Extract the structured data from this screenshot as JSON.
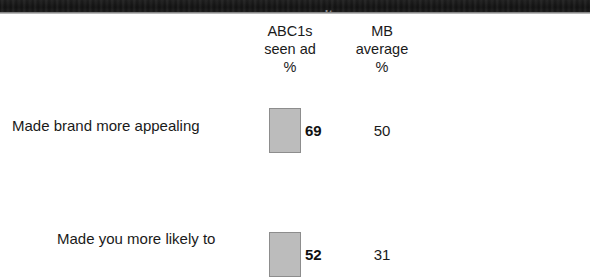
{
  "title_band": {
    "text": "survey results"
  },
  "table": {
    "columns": [
      {
        "id": "statement",
        "lines": []
      },
      {
        "id": "abc1s_seen_ad",
        "line1": "ABC1s",
        "line2": "seen ad",
        "line3": "%"
      },
      {
        "id": "mb_average",
        "line1": "MB",
        "line2": "average",
        "line3": "%"
      }
    ],
    "rows": [
      {
        "label": "Made brand more appealing",
        "label_line2": "",
        "abc1s_seen_ad": "69",
        "mb_average": "50"
      },
      {
        "label": "Made you more likely to",
        "label_line2": "",
        "abc1s_seen_ad": "52",
        "mb_average": "31"
      }
    ]
  },
  "chart_data": {
    "type": "bar",
    "title": "",
    "subtitle": "",
    "xlabel": "",
    "ylabel": "",
    "categories": [
      "Made brand more appealing",
      "Made you more likely to"
    ],
    "series": [
      {
        "name": "ABC1s seen ad %",
        "values": [
          69,
          50
        ]
      },
      {
        "name": "MB average %",
        "values": [
          52,
          31
        ]
      }
    ],
    "legend_position": "top",
    "grid": false,
    "bar_color": "#bcbcbc",
    "bar_border_color": "#8d8d8d"
  },
  "colors": {
    "background": "#ffffff",
    "text": "#1a1a1a",
    "band": "#161616",
    "bar_fill": "#bcbcbc",
    "bar_border": "#8d8d8d"
  }
}
